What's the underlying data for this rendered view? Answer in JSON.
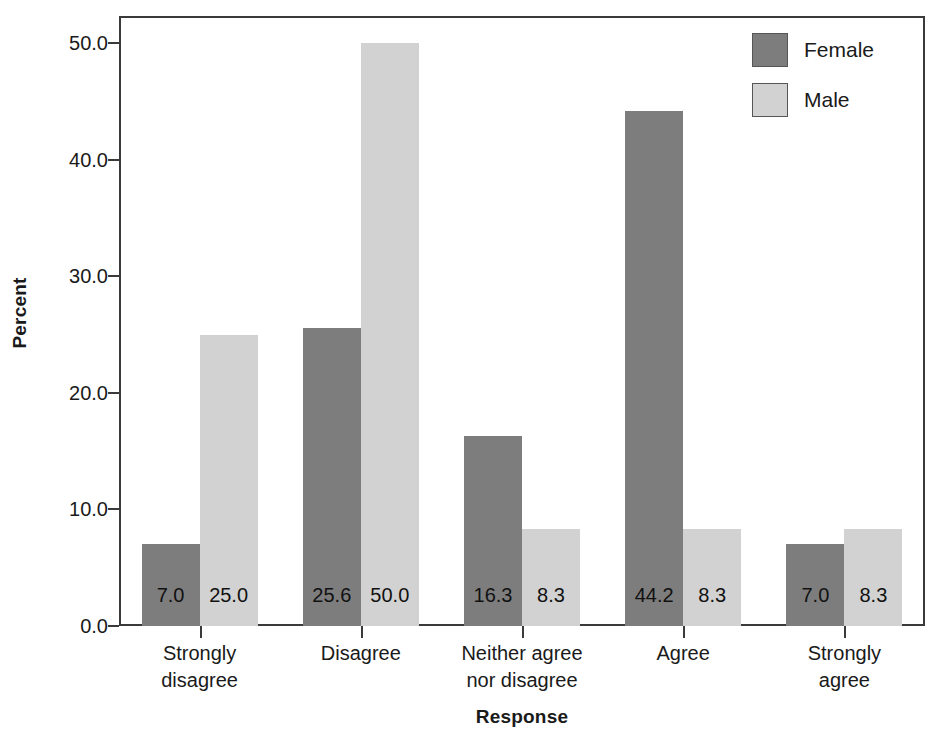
{
  "chart_data": {
    "type": "bar",
    "title": "",
    "xlabel": "Response",
    "ylabel": "Percent",
    "categories": [
      "Strongly disagree",
      "Disagree",
      "Neither agree nor disagree",
      "Agree",
      "Strongly agree"
    ],
    "category_lines": [
      [
        "Strongly",
        "disagree"
      ],
      [
        "Disagree",
        ""
      ],
      [
        "Neither agree",
        "nor disagree"
      ],
      [
        "Agree",
        ""
      ],
      [
        "Strongly",
        "agree"
      ]
    ],
    "series": [
      {
        "name": "Female",
        "color": "#7d7d7d",
        "values": [
          7.0,
          25.6,
          16.3,
          44.2,
          7.0
        ],
        "labels": [
          "7.0",
          "25.6",
          "16.3",
          "44.2",
          "7.0"
        ]
      },
      {
        "name": "Male",
        "color": "#d2d2d2",
        "values": [
          25.0,
          50.0,
          8.3,
          8.3,
          8.3
        ],
        "labels": [
          "25.0",
          "50.0",
          "8.3",
          "8.3",
          "8.3"
        ]
      }
    ],
    "ylim": [
      0.0,
      50.0
    ],
    "yticks": [
      0.0,
      10.0,
      20.0,
      30.0,
      40.0,
      50.0
    ],
    "ytick_labels": [
      "0.0",
      "10.0",
      "20.0",
      "30.0",
      "40.0",
      "50.0"
    ],
    "grid": false,
    "legend_position": "top-right",
    "bar_value_labels": true
  },
  "axes": {
    "y_title": "Percent",
    "x_title": "Response"
  },
  "legend": {
    "entries": [
      {
        "label": "Female",
        "color": "#7d7d7d"
      },
      {
        "label": "Male",
        "color": "#d2d2d2"
      }
    ]
  }
}
